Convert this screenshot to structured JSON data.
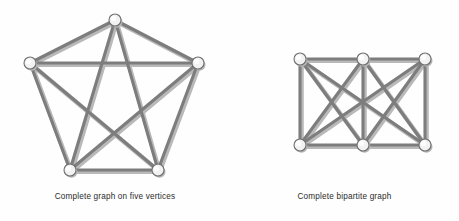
{
  "figure": {
    "background_color": "#fefefe",
    "edge_color": "#7d7d7d",
    "edge_shadow_color": "#b9b9b9",
    "vertex_fill": "#f2f2f2",
    "vertex_stroke": "#6f6f6f",
    "caption_color": "#2b2b2b"
  },
  "panels": [
    {
      "id": "complete-graph",
      "caption": "Complete graph on five vertices",
      "graph": {
        "name": "K5",
        "vertex_count": 5,
        "edge_count": 10,
        "vertex_radius": 6,
        "vertices": [
          {
            "id": "v1",
            "x": 115,
            "y": 20
          },
          {
            "id": "v2",
            "x": 198,
            "y": 63
          },
          {
            "id": "v3",
            "x": 158,
            "y": 170
          },
          {
            "id": "v4",
            "x": 70,
            "y": 170
          },
          {
            "id": "v5",
            "x": 30,
            "y": 63
          }
        ],
        "edges": [
          [
            "v1",
            "v2"
          ],
          [
            "v1",
            "v3"
          ],
          [
            "v1",
            "v4"
          ],
          [
            "v1",
            "v5"
          ],
          [
            "v2",
            "v3"
          ],
          [
            "v2",
            "v4"
          ],
          [
            "v2",
            "v5"
          ],
          [
            "v3",
            "v4"
          ],
          [
            "v3",
            "v5"
          ],
          [
            "v4",
            "v5"
          ]
        ]
      }
    },
    {
      "id": "bipartite-graph",
      "caption": "Complete bipartite graph",
      "graph": {
        "name": "K3,3",
        "vertex_count": 6,
        "edge_count": 9,
        "vertex_radius": 6,
        "vertices": [
          {
            "id": "t1",
            "x": 70,
            "y": 59
          },
          {
            "id": "t2",
            "x": 133,
            "y": 59
          },
          {
            "id": "t3",
            "x": 195,
            "y": 59
          },
          {
            "id": "b1",
            "x": 70,
            "y": 145
          },
          {
            "id": "b2",
            "x": 133,
            "y": 145
          },
          {
            "id": "b3",
            "x": 195,
            "y": 145
          }
        ],
        "edges": [
          [
            "t1",
            "b1"
          ],
          [
            "t1",
            "b2"
          ],
          [
            "t1",
            "b3"
          ],
          [
            "t2",
            "b1"
          ],
          [
            "t2",
            "b2"
          ],
          [
            "t2",
            "b3"
          ],
          [
            "t3",
            "b1"
          ],
          [
            "t3",
            "b2"
          ],
          [
            "t3",
            "b3"
          ],
          [
            "t1",
            "t2"
          ],
          [
            "t2",
            "t3"
          ],
          [
            "b1",
            "b2"
          ],
          [
            "b2",
            "b3"
          ]
        ]
      }
    }
  ]
}
